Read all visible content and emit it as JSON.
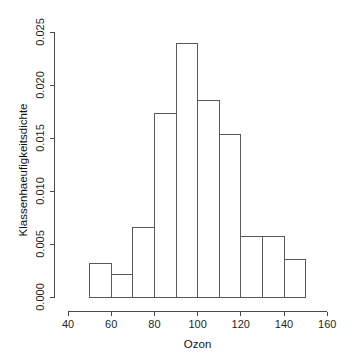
{
  "chart_data": {
    "type": "bar",
    "title": "",
    "subtitle": "",
    "xlabel": "Ozon",
    "ylabel": "Klassenhaeufigkeitsdichte",
    "xlim": [
      40,
      160
    ],
    "ylim": [
      0.0,
      0.025
    ],
    "grid": false,
    "legend": "none",
    "bin_width": 10,
    "bin_edges": [
      50,
      60,
      70,
      80,
      90,
      100,
      110,
      120,
      130,
      140,
      150
    ],
    "categories": [
      "50-60",
      "60-70",
      "70-80",
      "80-90",
      "90-100",
      "100-110",
      "110-120",
      "120-130",
      "130-140",
      "140-150"
    ],
    "values": [
      0.0032,
      0.0021,
      0.0066,
      0.0173,
      0.0239,
      0.0185,
      0.0153,
      0.0057,
      0.0057,
      0.0035
    ],
    "xticks": [
      {
        "value": 40,
        "label": "40"
      },
      {
        "value": 60,
        "label": "60"
      },
      {
        "value": 80,
        "label": "80"
      },
      {
        "value": 100,
        "label": "100"
      },
      {
        "value": 120,
        "label": "120"
      },
      {
        "value": 140,
        "label": "140"
      },
      {
        "value": 160,
        "label": "160"
      }
    ],
    "yticks": [
      {
        "value": 0.0,
        "label": "0.000"
      },
      {
        "value": 0.005,
        "label": "0.005"
      },
      {
        "value": 0.01,
        "label": "0.010"
      },
      {
        "value": 0.015,
        "label": "0.015"
      },
      {
        "value": 0.02,
        "label": "0.020"
      },
      {
        "value": 0.025,
        "label": "0.025"
      }
    ],
    "colors": {
      "bar_fill": "#ffffff",
      "bar_stroke": "#58585a",
      "axis": "#4a4a4a",
      "text": "#1f1f1f",
      "background": "#ffffff"
    }
  }
}
